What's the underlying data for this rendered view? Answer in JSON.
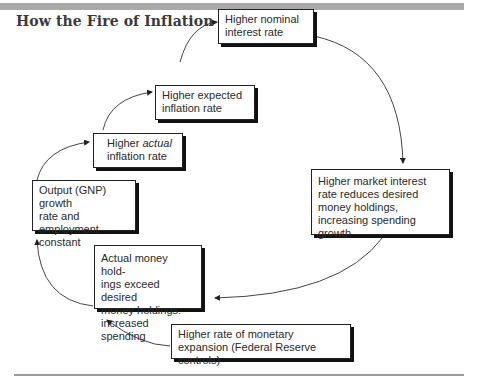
{
  "title": "How the Fire of Inflation Gets Fanned",
  "boxes": {
    "nominal": {
      "line1": "Higher nominal",
      "line2": "interest rate"
    },
    "expected": {
      "line1": "Higher expected",
      "line2": "inflation rate"
    },
    "actual": {
      "prefix": "Higher ",
      "italic": "actual",
      "line2": "inflation rate"
    },
    "output": {
      "line1": "Output (GNP) growth",
      "line2": "rate and employment",
      "line3": "constant"
    },
    "market": {
      "line1": "Higher market interest",
      "line2": "rate reduces desired",
      "line3": "money holdings,",
      "line4": "increasing spending growth"
    },
    "holdings": {
      "line1": "Actual money hold-",
      "line2": "ings exceed desired",
      "line3": "money holdings:",
      "line4": "increased spending"
    },
    "monetary": {
      "line1": "Higher rate of monetary",
      "line2": "expansion (Federal Reserve controls)"
    }
  },
  "colors": {
    "topbar": "#a9a9a9",
    "box_border": "#222222",
    "arrow": "#333333"
  }
}
